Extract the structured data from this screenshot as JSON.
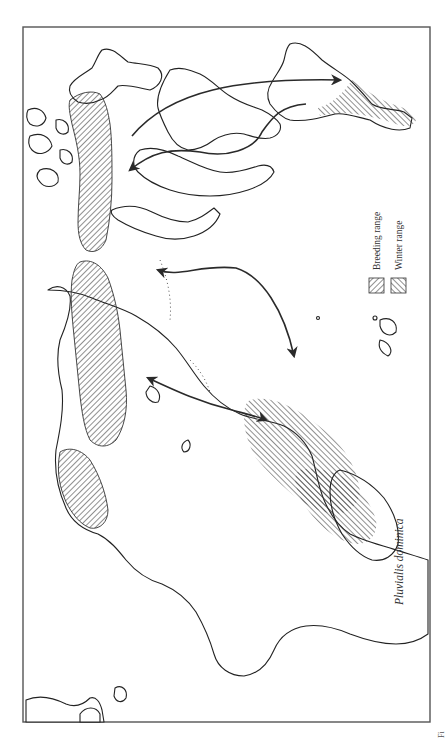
{
  "figure": {
    "title": "Pluvialis dominica",
    "fig_label_fragment": "Fi",
    "orientation": "rotated 90° (read with page turned clockwise)"
  },
  "legend": {
    "items": [
      {
        "label": "Breeding range",
        "pattern": "diagonal-hatch-right",
        "icon": "breeding-hatch-swatch"
      },
      {
        "label": "Winter range",
        "pattern": "diagonal-hatch-left",
        "icon": "winter-hatch-swatch"
      }
    ]
  },
  "map": {
    "regions": {
      "breeding": [
        "North American Arctic",
        "Siberian Arctic (eastern)",
        "Western Alaska / Chukotka"
      ],
      "winter": [
        "Southern South America (Pampas)",
        "South/Southeast Asia",
        "Australia / Pacific islands"
      ]
    },
    "routes": [
      {
        "id": "atlantic-southbound",
        "description": "Arctic Canada to South America (arrow to S. America)"
      },
      {
        "id": "interior-northbound",
        "description": "South America to Arctic Canada via interior (arrow to Arctic)"
      },
      {
        "id": "pacific-bidirectional",
        "description": "Alaska ⇄ Pacific islands / Hawaii"
      },
      {
        "id": "asia-bidirectional",
        "description": "Siberia ⇄ Southeast Asia / Australia"
      }
    ]
  },
  "colors": {
    "ink": "#222222",
    "frame": "#555555",
    "background": "#ffffff"
  }
}
